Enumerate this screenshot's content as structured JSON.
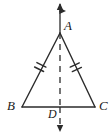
{
  "figure": {
    "background_color": "#ffffff",
    "stroke_color": "#2b2b2b",
    "label_color": "#1a1a1a",
    "width": 111,
    "height": 135
  },
  "labels": {
    "apex": "A",
    "base_left": "B",
    "base_right": "C",
    "foot": "D"
  },
  "geometry": {
    "points": {
      "A": {
        "x": 60,
        "y": 33
      },
      "B": {
        "x": 22,
        "y": 107
      },
      "C": {
        "x": 95,
        "y": 107
      },
      "D": {
        "x": 60,
        "y": 107
      }
    },
    "axis_line": {
      "style": "dashed",
      "top_y": 4,
      "bottom_y": 132,
      "x": 60,
      "arrow_top": true,
      "arrow_bottom": true
    },
    "tick_marks": {
      "side_AB": 2,
      "side_AC": 2,
      "note": "double hatch marks indicate AB congruent to AC"
    }
  }
}
